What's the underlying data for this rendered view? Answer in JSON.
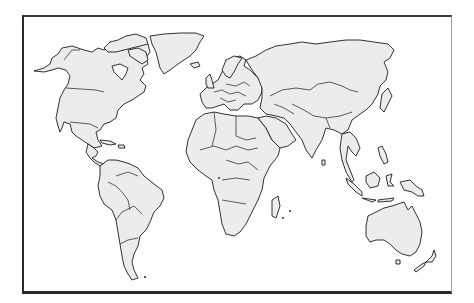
{
  "map": {
    "type": "blank political world map",
    "projection": "Robinson-like",
    "colors": {
      "background": "#ffffff",
      "land_fill": "#ececec",
      "outline": "#1c1c1c",
      "frame": "#2a2a2a"
    },
    "regions": [
      {
        "id": "north-america",
        "label": "North America"
      },
      {
        "id": "greenland",
        "label": "Greenland"
      },
      {
        "id": "south-america",
        "label": "South America"
      },
      {
        "id": "europe",
        "label": "Europe"
      },
      {
        "id": "africa",
        "label": "Africa"
      },
      {
        "id": "asia",
        "label": "Asia"
      },
      {
        "id": "southeast-asia",
        "label": "Southeast Asia"
      },
      {
        "id": "australia",
        "label": "Australia"
      },
      {
        "id": "new-zealand",
        "label": "New Zealand"
      },
      {
        "id": "madagascar",
        "label": "Madagascar"
      },
      {
        "id": "japan",
        "label": "Japan"
      },
      {
        "id": "united-kingdom",
        "label": "United Kingdom"
      }
    ]
  }
}
